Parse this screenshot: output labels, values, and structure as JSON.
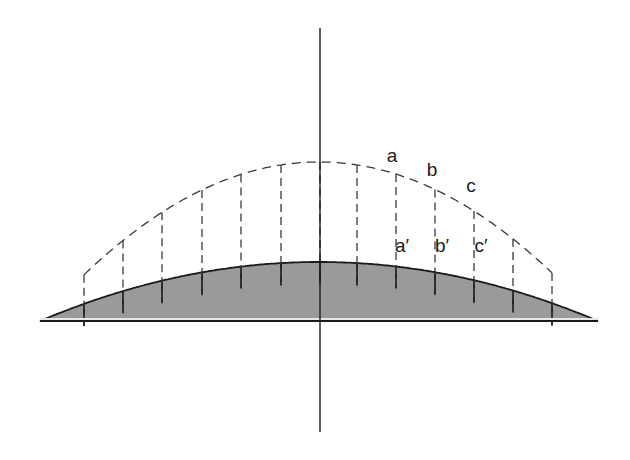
{
  "figure": {
    "canvas": {
      "width": 630,
      "height": 460,
      "background": "#ffffff"
    },
    "colors": {
      "body_fill": "#9a9a9a",
      "body_stroke": "#1a1a1a",
      "dashed_stroke": "#3a3a3a",
      "axis_stroke": "#1a1a1a",
      "base_highlight": "#e8e8e8",
      "label_color": "#1a1a1a"
    },
    "center_axis": {
      "name": "vertical-center-axis",
      "x": 320,
      "y_top": 28,
      "y_bottom": 432,
      "stroke_width": 1.4
    },
    "base_line": {
      "x_left": 40,
      "x_right": 598,
      "y": 321
    },
    "arch": {
      "left_foot_x": 40,
      "right_foot_x": 598,
      "base_y": 321,
      "apex_y": 262,
      "dashed_outer_apex_y": 162,
      "dashed_outer_left_x": 84,
      "dashed_outer_right_x": 552
    },
    "segments": {
      "count": 14,
      "dashed_divider_x": [
        84,
        123,
        162,
        202,
        241,
        281,
        320,
        357,
        396,
        435,
        474,
        513,
        552
      ],
      "tooth_drop_depth": 22
    },
    "labels": {
      "upper": [
        {
          "text": "a",
          "x": 392,
          "y": 162
        },
        {
          "text": "b",
          "x": 432,
          "y": 176
        },
        {
          "text": "c",
          "x": 471,
          "y": 192
        }
      ],
      "lower": [
        {
          "text": "a′",
          "x": 402,
          "y": 252
        },
        {
          "text": "b′",
          "x": 442,
          "y": 252
        },
        {
          "text": "c′",
          "x": 481,
          "y": 252
        }
      ]
    }
  }
}
